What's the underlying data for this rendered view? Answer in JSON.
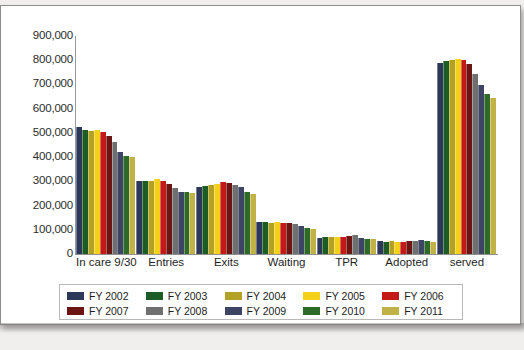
{
  "chart_data": {
    "type": "bar",
    "title": "",
    "subtitle": "",
    "xlabel": "",
    "ylabel": "",
    "ylim": [
      0,
      900000
    ],
    "ytick_labels": [
      "900,000",
      "800,000",
      "700,000",
      "600,000",
      "500,000",
      "400,000",
      "300,000",
      "200,000",
      "100,000",
      "0"
    ],
    "ytick_values": [
      900000,
      800000,
      700000,
      600000,
      500000,
      400000,
      300000,
      200000,
      100000,
      0
    ],
    "grid": false,
    "legend_position": "bottom",
    "categories": [
      "In care 9/30",
      "Entries",
      "Exits",
      "Waiting",
      "TPR",
      "Adopted",
      "served"
    ],
    "series": [
      {
        "name": "FY 2002",
        "color": "#2c3759",
        "values": [
          523000,
          303000,
          277000,
          131000,
          68000,
          53000,
          790000
        ]
      },
      {
        "name": "FY 2003",
        "color": "#1d5c24",
        "values": [
          510000,
          300000,
          279000,
          132000,
          71000,
          50000,
          795000
        ]
      },
      {
        "name": "FY 2004",
        "color": "#b3a125",
        "values": [
          508000,
          303000,
          284000,
          130000,
          71000,
          52000,
          800000
        ]
      },
      {
        "name": "FY 2005",
        "color": "#f4d018",
        "values": [
          512000,
          310000,
          289000,
          132000,
          69000,
          51000,
          805000
        ]
      },
      {
        "name": "FY 2006",
        "color": "#c41a17",
        "values": [
          505000,
          301000,
          297000,
          130000,
          71000,
          51000,
          800000
        ]
      },
      {
        "name": "FY 2007",
        "color": "#6d1512",
        "values": [
          487000,
          290000,
          295000,
          129000,
          75000,
          52000,
          783000
        ]
      },
      {
        "name": "FY 2008",
        "color": "#6f6f6f",
        "values": [
          463000,
          273000,
          285000,
          123000,
          77000,
          55000,
          744000
        ]
      },
      {
        "name": "FY 2009",
        "color": "#3e4463",
        "values": [
          423000,
          256000,
          276000,
          114000,
          68000,
          57000,
          698000
        ]
      },
      {
        "name": "FY 2010",
        "color": "#2e6b28",
        "values": [
          405000,
          254000,
          254000,
          107000,
          64000,
          53000,
          662000
        ]
      },
      {
        "name": "FY 2011",
        "color": "#c0b247",
        "values": [
          401000,
          252000,
          246000,
          104000,
          61000,
          51000,
          646000
        ]
      }
    ]
  },
  "legend": {
    "row1": [
      {
        "label": "FY 2002",
        "color": "#2c3759"
      },
      {
        "label": "FY 2003",
        "color": "#1d5c24"
      },
      {
        "label": "FY 2004",
        "color": "#b3a125"
      },
      {
        "label": "FY 2005",
        "color": "#f4d018"
      },
      {
        "label": "FY 2006",
        "color": "#c41a17"
      }
    ],
    "row2": [
      {
        "label": "FY 2007",
        "color": "#6d1512"
      },
      {
        "label": "FY 2008",
        "color": "#6f6f6f"
      },
      {
        "label": "FY 2009",
        "color": "#3e4463"
      },
      {
        "label": "FY 2010",
        "color": "#2e6b28"
      },
      {
        "label": "FY 2011",
        "color": "#c0b247"
      }
    ]
  }
}
